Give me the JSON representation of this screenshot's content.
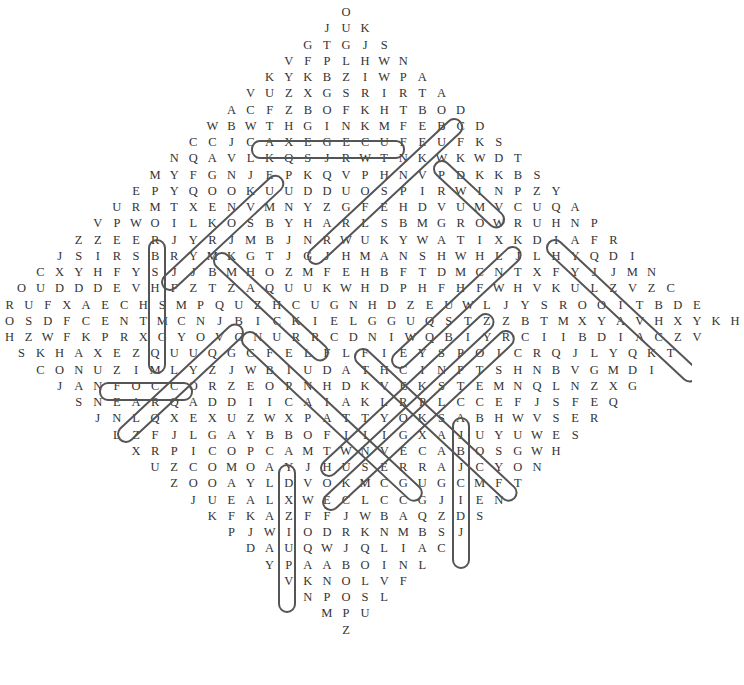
{
  "puzzle": {
    "rows": [
      "O",
      "JUK",
      "GTGJS",
      "VFPLHWN",
      "KYKBZIWPA",
      "VUZXGSRIRTA",
      "ACFZBOFKHTBOD",
      "WBWTHGINKMFEBCD",
      "CCJCAXEGECUFEUFKS",
      "NQAVLKQSJRWTNKWKWDT",
      "MYFGNJEPKQVPHNVPDKKBS",
      "EPYQOOKUUDDUOSPIRWINPZY",
      "URMTXENVMNYZGFEHDVUMVCUQA",
      "VPWOILKOSBYHARLSBMGROWRUHNP",
      "ZZEERJYRJMBJNRWUKYWATIXKDIAFR",
      "JSIRSBRYMKGTJGJHMANSHWHLJLHYQDI",
      "CXYHFYSJJBMHOZMFEHBFTDMCNTXFYJJMN",
      "OUDDDEVHFZTZAQUUKWHDPHFHFWHVKULZVZC",
      "RUFXAECHSMPQUZHCUGNHDZEUWLJYSROOITBDE",
      "OSDFCENTMCNJBICKIELGGUQSTZZBTMXYAVHXYKH",
      "HZWFKPRXGYOVCNURRCDNIWQBIYRCIIBDIACZV",
      "SKHAXEZQUUQGCFELFLFIEYSPOICRQJLYQKT",
      "CONUZIMLYZJWBIUDATHCINPTSHNBVGMDI",
      "JANFOCCORZEOPNHDKVEKSTEMNQLNZXG",
      "SNEARQADDIICAIAKLRPLCCEFJSFEQ",
      "JNLQXEXUZWXPATTYOKSABHWVSER",
      "LZFJLGAYBBOFIIIGXAJUYUWES",
      "XRPICOPCAMTWNVECABOSGWH",
      "UZCOMOAYJHUSERRAJCYON",
      "ZOOAYLDVOKMCGUGCMFT",
      "JUEALXWECLCCGJIEN",
      "KFKAZFFJWBAQZDS",
      "PJWIODRKNMBSJ",
      "DAUQWJQLIAC",
      "YPAABOINL",
      "VKNOLVF",
      "NPOSL",
      "MPU",
      "Z"
    ],
    "found_words": [
      {
        "word": "THGINK",
        "direction": "horizontal"
      },
      {
        "word": "PERFECT",
        "direction": "vertical"
      },
      {
        "word": "ONUZIM",
        "direction": "horizontal"
      },
      {
        "word": "CALLAWAY",
        "direction": "vertical"
      },
      {
        "word": "ROGERGCAM",
        "direction": "vertical"
      }
    ]
  }
}
